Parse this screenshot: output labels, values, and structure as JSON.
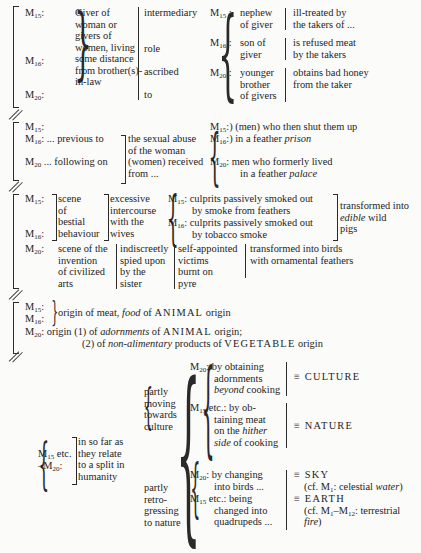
{
  "block1": {
    "left_labels": [
      "M15:",
      "M16:",
      "M20:"
    ],
    "giver_text": [
      "Giver of",
      "woman or",
      "givers of",
      "women, living",
      "some distance",
      "from brother(s)-",
      "in-law"
    ],
    "role_text": [
      "intermediary",
      "role",
      "ascribed",
      "to"
    ],
    "rows": [
      {
        "label": "M15",
        "who": [
          "nephew",
          "of giver"
        ],
        "fate": [
          "ill-treated by",
          "the takers of ..."
        ]
      },
      {
        "label": "M16",
        "who": [
          "son of",
          "giver"
        ],
        "fate": [
          "is refused meat",
          "by the takers"
        ]
      },
      {
        "label": "M20",
        "who": [
          "younger",
          "brother",
          "of givers"
        ],
        "fate": [
          "obtains bad honey",
          "from the taker"
        ]
      }
    ]
  },
  "block2": {
    "labels": [
      "M15:",
      "M16: ... previous to",
      "M20 ... following on"
    ],
    "abuse_text": [
      "the sexual abuse",
      "of the woman",
      "(women) received",
      "from ..."
    ],
    "right": [
      {
        "labels": "M15:",
        "text": "(men) who then shut them up"
      },
      {
        "labels": "M16:",
        "text_plain": "in a feather ",
        "text_italic": "prison"
      },
      {
        "labels": "M20:",
        "text": "men who formerly lived"
      },
      {
        "labels": "",
        "text_plain": "in a feather ",
        "text_italic": "palace"
      }
    ]
  },
  "block3": {
    "labels": [
      "M15:",
      "M16:",
      "M20:"
    ],
    "scene_bestial": [
      "scene",
      "of",
      "bestial",
      "behaviour"
    ],
    "intercourse": [
      "excessive",
      "intercourse",
      "with the",
      "wives"
    ],
    "culprits": [
      {
        "label": "M15:",
        "lines": [
          "culprits passively smoked out",
          "by smoke from feathers"
        ]
      },
      {
        "label": "M16:",
        "lines": [
          "culprits passively smoked out",
          "by tobacco smoke"
        ]
      }
    ],
    "transformed_pigs": {
      "line1": "transformed into",
      "italic": "edible",
      "rest": " wild",
      "line3": "pigs"
    },
    "m20_scene": [
      "scene of the",
      "invention",
      "of civilized",
      "arts"
    ],
    "m20_spied": [
      "indiscreetly",
      "spied upon",
      "by the",
      "sister"
    ],
    "m20_victims": [
      "self-appointed",
      "victims",
      "burnt on",
      "pyre"
    ],
    "m20_birds": [
      "transformed into birds",
      "with ornamental feathers"
    ]
  },
  "block4": {
    "labels": [
      "M15:",
      "M16:",
      "M20:"
    ],
    "line1": {
      "pre": "origin of meat, ",
      "italic": "food",
      "mid": " of ",
      "caps": "ANIMAL",
      "post": " origin"
    },
    "line2": {
      "pre": "origin (1) of ",
      "italic": "adornments",
      "mid": " of ",
      "caps": "ANIMAL",
      "post": " origin;"
    },
    "line3": {
      "pre": "(2) of ",
      "italic": "non-alimentary",
      "mid": " products of ",
      "caps": "VEGETABLE",
      "post": " origin"
    }
  },
  "block5": {
    "left_label": [
      "M15 etc.",
      "–M20:"
    ],
    "relate": [
      "in so far as",
      "they relate",
      "to a split in",
      "humanity"
    ],
    "culture_branch": [
      "partly",
      "moving",
      "towards",
      "culture"
    ],
    "nature_branch": [
      "partly",
      "retro-",
      "gressing",
      "to nature"
    ],
    "m20_obtaining": [
      "M20: by obtaining",
      "adornments",
      "beyond cooking"
    ],
    "m15_obtaining": [
      "M15 etc.: by ob-",
      "taining meat",
      "on the hither",
      "side of cooking"
    ],
    "culture": "≡ CULTURE",
    "nature": "≡ NATURE",
    "m20_changing": [
      "M20: by changing",
      "into birds ..."
    ],
    "m15_being": [
      "M15 etc.: being",
      "changed into",
      "quadrupeds ..."
    ],
    "sky": "≡ SKY",
    "sky_cf": {
      "pre": "(cf. M1: celestial ",
      "italic": "water",
      "post": ")"
    },
    "earth": "≡ EARTH",
    "earth_cf": {
      "pre": "(cf. M1–M12: terrestrial",
      "italic": "fire",
      "post": ")"
    }
  }
}
